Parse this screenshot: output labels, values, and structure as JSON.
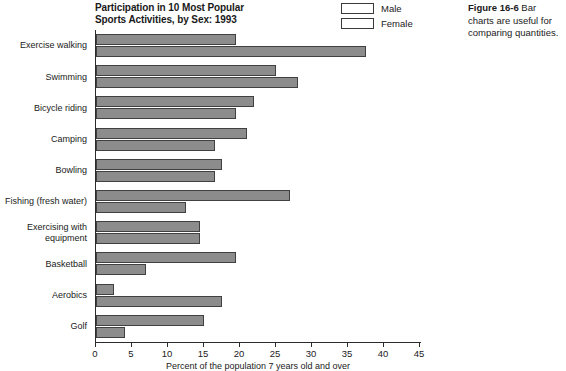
{
  "chart_data": {
    "type": "bar",
    "orientation": "horizontal",
    "title": "Participation in 10 Most Popular Sports Activities, by Sex: 1993",
    "title_line1": "Participation in 10 Most Popular",
    "title_line2": "Sports Activities, by Sex: 1993",
    "xlabel": "Percent of the population 7 years old and over",
    "ylabel": "",
    "xlim": [
      0,
      45
    ],
    "xticks": [
      0,
      5,
      10,
      15,
      20,
      25,
      30,
      35,
      40,
      45
    ],
    "grid": false,
    "legend_position": "top-right",
    "categories": [
      "Exercise walking",
      "Swimming",
      "Bicycle riding",
      "Camping",
      "Bowling",
      "Fishing (fresh water)",
      "Exercising with equipment",
      "Basketball",
      "Aerobics",
      "Golf"
    ],
    "series": [
      {
        "name": "Male",
        "color": "#8c8c8c",
        "values": [
          19.5,
          25.0,
          22.0,
          21.0,
          17.5,
          27.0,
          14.5,
          19.5,
          2.5,
          15.0
        ]
      },
      {
        "name": "Female",
        "color": "#8c8c8c",
        "values": [
          37.5,
          28.0,
          19.5,
          16.5,
          16.5,
          12.5,
          14.5,
          7.0,
          17.5,
          4.0
        ]
      }
    ]
  },
  "legend": {
    "items": [
      {
        "label": "Male"
      },
      {
        "label": "Female"
      }
    ]
  },
  "caption": {
    "label": "Figure 16-6",
    "text": " Bar charts are useful for comparing quantities."
  },
  "colors": {
    "bar_fill": "#8c8c8c",
    "bar_stroke": "#404040",
    "axis": "#2b2b2b",
    "text": "#1a1a1a",
    "background": "#ffffff"
  }
}
